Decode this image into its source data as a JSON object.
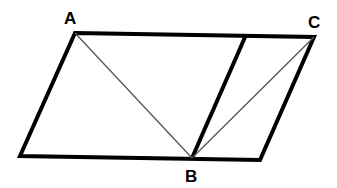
{
  "diagram": {
    "type": "geometry",
    "labels": {
      "A": "A",
      "B": "B",
      "C": "C"
    },
    "points": {
      "A": [
        75,
        33
      ],
      "C": [
        314,
        37
      ],
      "top_mid": [
        246,
        35
      ],
      "bottom_left": [
        20,
        156
      ],
      "B": [
        192,
        158
      ],
      "bottom_right": [
        260,
        160
      ]
    },
    "colors": {
      "stroke": "#000000",
      "thin_stroke": "#555555",
      "background": "#ffffff"
    }
  }
}
